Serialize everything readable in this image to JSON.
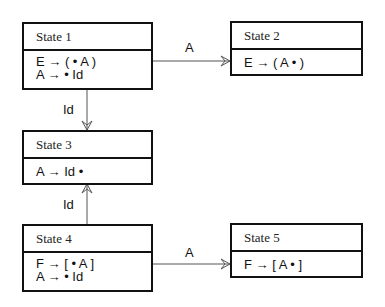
{
  "diagram": {
    "type": "state-diagram",
    "states": [
      {
        "id": "s1",
        "title": "State 1",
        "items": [
          "E → ( • A )",
          "A → • Id"
        ]
      },
      {
        "id": "s2",
        "title": "State 2",
        "items": [
          "E → ( A • )"
        ]
      },
      {
        "id": "s3",
        "title": "State 3",
        "items": [
          "A → Id •"
        ]
      },
      {
        "id": "s4",
        "title": "State 4",
        "items": [
          "F → [ • A ]",
          "A → • Id"
        ]
      },
      {
        "id": "s5",
        "title": "State 5",
        "items": [
          "F → [ A • ]"
        ]
      }
    ],
    "transitions": [
      {
        "from": "State 1",
        "to": "State 2",
        "label": "A"
      },
      {
        "from": "State 1",
        "to": "State 3",
        "label": "Id"
      },
      {
        "from": "State 4",
        "to": "State 3",
        "label": "Id"
      },
      {
        "from": "State 4",
        "to": "State 5",
        "label": "A"
      }
    ]
  }
}
